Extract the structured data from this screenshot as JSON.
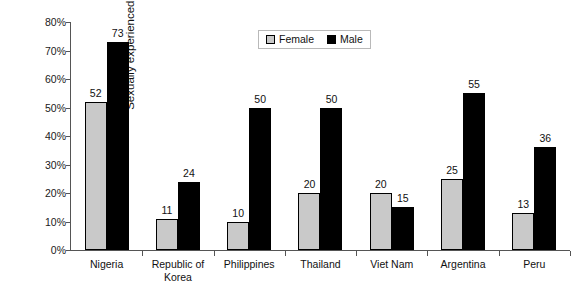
{
  "chart_data": {
    "type": "bar",
    "title": "",
    "xlabel": "",
    "ylabel": "Sexually experienced young people",
    "ylim": [
      0,
      80
    ],
    "grid": false,
    "legend_position": "top-center",
    "ytick_labels": [
      "80%",
      "70%",
      "60%",
      "50%",
      "40%",
      "30%",
      "20%",
      "10%",
      "0%"
    ],
    "ytick_values": [
      80,
      70,
      60,
      50,
      40,
      30,
      20,
      10,
      0
    ],
    "categories": [
      "Nigeria",
      "Republic of Korea",
      "Philippines",
      "Thailand",
      "Viet Nam",
      "Argentina",
      "Peru"
    ],
    "category_lines": [
      [
        "Nigeria"
      ],
      [
        "Republic of",
        "Korea"
      ],
      [
        "Philippines"
      ],
      [
        "Thailand"
      ],
      [
        "Viet Nam"
      ],
      [
        "Argentina"
      ],
      [
        "Peru"
      ]
    ],
    "series": [
      {
        "name": "Female",
        "color": "#c9c9c9",
        "values": [
          52,
          11,
          10,
          20,
          20,
          25,
          13
        ],
        "labels": [
          "52",
          "11",
          "10",
          "20",
          "20",
          "25",
          "13"
        ]
      },
      {
        "name": "Male",
        "color": "#000000",
        "values": [
          73,
          24,
          50,
          50,
          15,
          55,
          36
        ],
        "labels": [
          "73",
          "24",
          "50",
          "50",
          "15",
          "55",
          "36"
        ]
      }
    ]
  },
  "legend": {
    "items": [
      {
        "label": "Female",
        "swatch": "female-swatch-icon"
      },
      {
        "label": "Male",
        "swatch": "male-swatch-icon"
      }
    ]
  },
  "colors": {
    "female": "#c9c9c9",
    "male": "#000000",
    "axis": "#555555",
    "text": "#111111",
    "background": "#ffffff"
  }
}
